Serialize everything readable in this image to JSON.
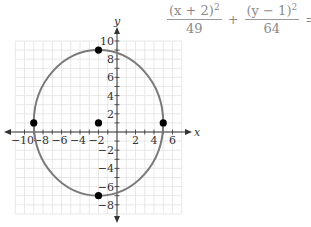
{
  "chart_data": {
    "type": "scatter",
    "title": "",
    "equation": {
      "term1_numerator": "(x + 2)",
      "term1_exponent": "2",
      "term1_denominator": "49",
      "plus": "+",
      "term2_numerator": "(y − 1)",
      "term2_exponent": "2",
      "term2_denominator": "64",
      "equals": "= 1"
    },
    "xlabel": "x",
    "ylabel": "y",
    "xlim": [
      -11,
      7
    ],
    "ylim": [
      -9,
      10
    ],
    "grid": true,
    "x_tick_labels": [
      "-10",
      "-8",
      "-6",
      "-4",
      "-2",
      "2",
      "4",
      "6"
    ],
    "x_ticks": [
      -10,
      -8,
      -6,
      -4,
      -2,
      2,
      4,
      6
    ],
    "y_tick_labels": [
      "10",
      "8",
      "6",
      "4",
      "2",
      "-2",
      "-4",
      "-6",
      "-8"
    ],
    "y_ticks": [
      10,
      8,
      6,
      4,
      2,
      -2,
      -4,
      -6,
      -8
    ],
    "ellipse": {
      "center": [
        -2,
        1
      ],
      "a": 7,
      "b": 8,
      "color": "#7a7a7a"
    },
    "points": [
      {
        "label": "center",
        "x": -2,
        "y": 1
      },
      {
        "label": "vertex-top",
        "x": -2,
        "y": 9
      },
      {
        "label": "vertex-bottom",
        "x": -2,
        "y": -7
      },
      {
        "label": "co-vertex-left",
        "x": -9,
        "y": 1
      },
      {
        "label": "co-vertex-right",
        "x": 5,
        "y": 1
      }
    ],
    "colors": {
      "grid": "#e2e2e2",
      "axis": "#333333",
      "curve": "#7a7a7a",
      "point": "#000000",
      "tick_label": "#333333"
    }
  }
}
